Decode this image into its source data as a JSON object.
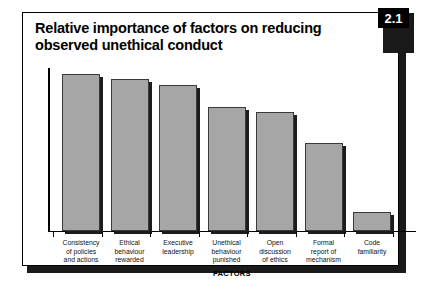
{
  "figure": {
    "badge": "2.1",
    "title_line_1": "Relative importance of factors on reducing",
    "title_line_2": "observed unethical conduct"
  },
  "chart_data": {
    "type": "bar",
    "title": "Relative importance of factors on reducing observed unethical conduct",
    "xlabel": "FACTORS",
    "ylabel": "",
    "grid": false,
    "legend": "none",
    "ylim": [
      0,
      100
    ],
    "axis_tick_labels": [],
    "categories": [
      "Consistency of policies and actions",
      "Ethical behaviour rewarded",
      "Executive leadership",
      "Unethical behaviour punished",
      "Open discussion of ethics",
      "Formal report of mechanism",
      "Code familiarity"
    ],
    "category_lines": [
      [
        "Consistency",
        "of policies",
        "and actions"
      ],
      [
        "Ethical",
        "behaviour",
        "rewarded"
      ],
      [
        "Executive",
        "leadership"
      ],
      [
        "Unethical",
        "behaviour",
        "punished"
      ],
      [
        "Open",
        "discussion",
        "of ethics"
      ],
      [
        "Formal",
        "report of",
        "mechanism"
      ],
      [
        "Code",
        "familiarity"
      ]
    ],
    "values": [
      100,
      97,
      93,
      79,
      76,
      56,
      12
    ],
    "bar_color": "#a6a6a6",
    "bar_edge_color": "#3a3a3a"
  }
}
